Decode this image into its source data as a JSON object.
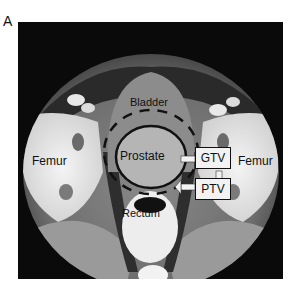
{
  "figure": {
    "panel_label": "A",
    "labels": {
      "bladder": "Bladder",
      "prostate": "Prostate",
      "rectum": "Rectum",
      "femur_left": "Femur",
      "femur_right": "Femur"
    },
    "legend": {
      "gtv": "GTV",
      "ptv": "PTV"
    },
    "colors": {
      "background": "#0a0a0a",
      "box_fill": "#f2f2f2",
      "outline": "#111111"
    }
  }
}
